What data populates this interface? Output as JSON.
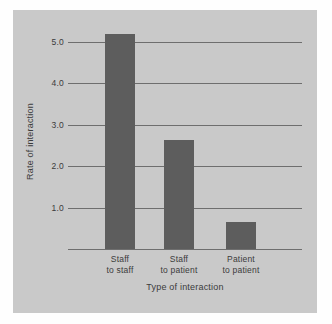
{
  "chart_data": {
    "type": "bar",
    "title": "",
    "categories": [
      "Staff to staff",
      "Staff to patient",
      "Patient to patient"
    ],
    "category_lines": [
      [
        "Staff",
        "to staff"
      ],
      [
        "Staff",
        "to patient"
      ],
      [
        "Patient",
        "to patient"
      ]
    ],
    "values": [
      5.2,
      2.65,
      0.67
    ],
    "xlabel": "Type of interaction",
    "ylabel": "Rate of interaction",
    "ylim": [
      0,
      5.6
    ],
    "yticks": [
      1.0,
      2.0,
      3.0,
      4.0,
      5.0
    ],
    "ytick_labels": [
      "1.0",
      "2.0",
      "3.0",
      "4.0",
      "5.0"
    ],
    "grid": true,
    "legend": null,
    "colors": {
      "bar": "#5d5d5d",
      "panel_background": "#c9c9c9",
      "page_background": "#fefefe",
      "axis": "#6e6e6e",
      "text": "#3b3b3b"
    }
  }
}
